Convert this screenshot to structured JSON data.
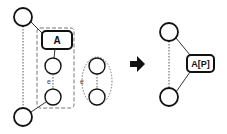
{
  "diagram": {
    "left": {
      "box_label": "A",
      "edge_label": "e",
      "pair_edge_label": "e"
    },
    "arrow": "right-arrow",
    "right": {
      "box_label": "A[P]"
    },
    "colors": {
      "stroke": "#111111",
      "dashed": "#666666",
      "background": "#ffffff"
    }
  }
}
